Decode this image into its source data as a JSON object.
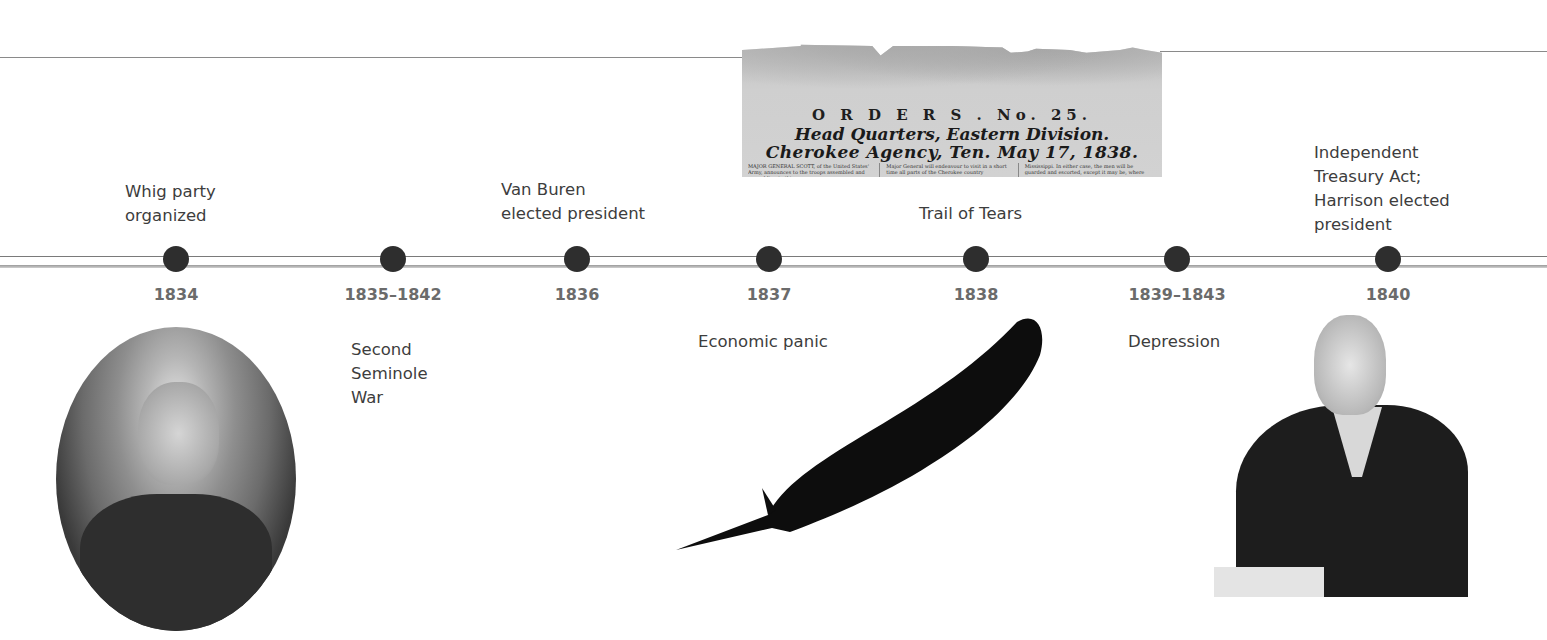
{
  "timeline": {
    "line_color": "#7a7a7a",
    "dot_color": "#2e2e2e",
    "year_color": "#6b6b6b",
    "entries": [
      {
        "year": "1834",
        "x": 176,
        "event": "Whig party\norganized",
        "event_position": "above"
      },
      {
        "year": "1835–1842",
        "x": 393,
        "event": "Second\nSeminole\nWar",
        "event_position": "below"
      },
      {
        "year": "1836",
        "x": 577,
        "event": "Van Buren\nelected president",
        "event_position": "above"
      },
      {
        "year": "1837",
        "x": 769,
        "event": "Economic panic",
        "event_position": "below"
      },
      {
        "year": "1838",
        "x": 976,
        "event": "Trail of Tears",
        "event_position": "above"
      },
      {
        "year": "1839–1843",
        "x": 1177,
        "event": "Depression",
        "event_position": "below"
      },
      {
        "year": "1840",
        "x": 1388,
        "event": "Independent\nTreasury Act;\nHarrison elected\npresident",
        "event_position": "above"
      }
    ]
  },
  "images": {
    "newspaper": {
      "title": "O R D E R S .  No. 25.",
      "headline_1": "Head Quarters, Eastern Division.",
      "headline_2": "Cherokee Agency, Ten. May 17, 1838.",
      "body_columns": [
        "MAJOR GENERAL SCOTT, of the United States' Army, announces to the troops assembled and assembling in this coun-",
        "Major General will endeavour to visit in a short time all parts of the Cherokee country",
        "Mississippi. In either case, the men will be guarded and escorted, except it may be, where"
      ]
    },
    "portrait_left": "portrait of Henry Clay (oval photograph)",
    "feather": "black feather",
    "portrait_right": "portrait of William Henry Harrison writing with quill"
  }
}
